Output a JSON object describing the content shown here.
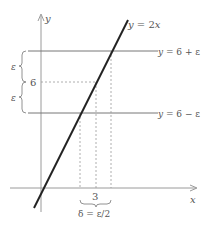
{
  "diagram": {
    "labels": {
      "y_axis": "y",
      "x_axis": "x",
      "line": "y = 2x",
      "upper": "y = 6 + ε",
      "lower": "y = 6 − ε",
      "six": "6",
      "three": "3",
      "eps_top": "ε",
      "eps_bottom": "ε",
      "delta": "δ = ε/2"
    },
    "colors": {
      "axis": "#999999",
      "line": "#222222",
      "guide": "#777777",
      "dashed": "#999999",
      "text": "#555555"
    }
  }
}
